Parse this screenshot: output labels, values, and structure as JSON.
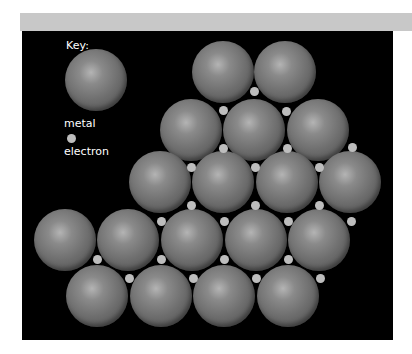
{
  "key": {
    "title": "Key:",
    "metal_label": "metal",
    "electron_label": "electron"
  },
  "colors": {
    "background": "#000000",
    "metal": "#6c6c6c",
    "electron": "#bdbdbd"
  },
  "lattice": {
    "metal_atoms": [
      [
        223,
        72
      ],
      [
        285,
        72
      ],
      [
        191,
        130
      ],
      [
        254,
        130
      ],
      [
        318,
        130
      ],
      [
        160,
        182
      ],
      [
        223,
        182
      ],
      [
        287,
        182
      ],
      [
        350,
        182
      ],
      [
        65,
        240
      ],
      [
        128,
        240
      ],
      [
        192,
        240
      ],
      [
        256,
        240
      ],
      [
        319,
        240
      ],
      [
        97,
        296
      ],
      [
        161,
        296
      ],
      [
        224,
        296
      ],
      [
        288,
        296
      ]
    ],
    "electrons": [
      [
        254,
        91
      ],
      [
        223,
        110
      ],
      [
        286,
        111
      ],
      [
        223,
        148
      ],
      [
        287,
        148
      ],
      [
        352,
        147
      ],
      [
        191,
        167
      ],
      [
        255,
        167
      ],
      [
        319,
        167
      ],
      [
        191,
        205
      ],
      [
        255,
        205
      ],
      [
        319,
        205
      ],
      [
        161,
        221
      ],
      [
        224,
        221
      ],
      [
        288,
        221
      ],
      [
        351,
        221
      ],
      [
        97,
        259
      ],
      [
        161,
        259
      ],
      [
        224,
        259
      ],
      [
        288,
        259
      ],
      [
        129,
        278
      ],
      [
        193,
        278
      ],
      [
        256,
        278
      ],
      [
        320,
        278
      ]
    ]
  }
}
